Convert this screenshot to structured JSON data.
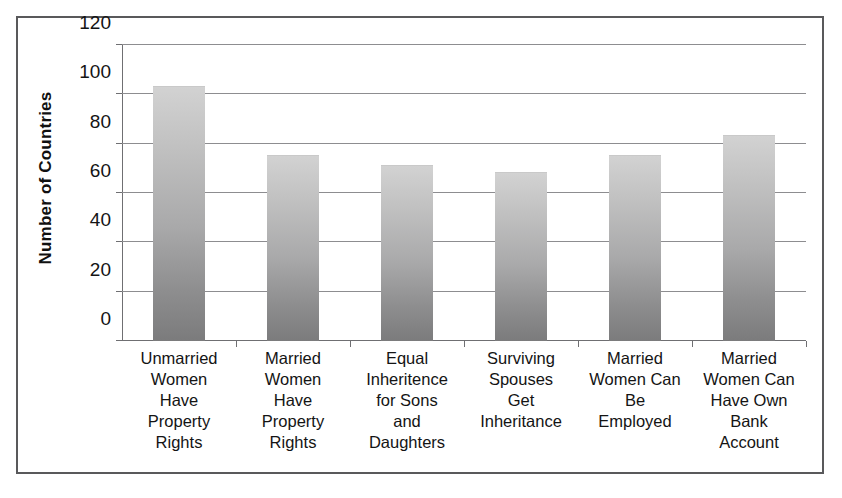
{
  "chart_data": {
    "type": "bar",
    "title": "",
    "xlabel": "",
    "ylabel": "Number of Countries",
    "ylim": [
      0,
      120
    ],
    "ytick_labels": [
      "0",
      "20",
      "40",
      "60",
      "80",
      "100",
      "120"
    ],
    "yticks": [
      0,
      20,
      40,
      60,
      80,
      100,
      120
    ],
    "grid": true,
    "legend": false,
    "categories": [
      "Unmarried Women Have Property Rights",
      "Married Women Have Property Rights",
      "Equal Inheritance for Sons and Daughters",
      "Surviving Spouses Get Inheritance",
      "Married Women Can Be Employed",
      "Married Women Can Have Own Bank Account"
    ],
    "category_lines": [
      [
        "Unmarried",
        "Women",
        "Have",
        "Property",
        "Rights"
      ],
      [
        "Married",
        "Women",
        "Have",
        "Property",
        "Rights"
      ],
      [
        "Equal",
        "Inheritence",
        "for Sons",
        "and",
        "Daughters"
      ],
      [
        "Surviving",
        "Spouses",
        "Get",
        "Inheritance"
      ],
      [
        "Married",
        "Women Can",
        "Be",
        "Employed"
      ],
      [
        "Married",
        "Women Can",
        "Have Own",
        "Bank",
        "Account"
      ]
    ],
    "values": [
      103,
      75,
      71,
      68,
      75,
      83
    ],
    "bar_color_top": "#d2d2d2",
    "bar_color_bottom": "#7b7b7c",
    "axis_color": "#6f6f72",
    "grid_color": "#8d8d90",
    "frame_color": "#59595b"
  }
}
